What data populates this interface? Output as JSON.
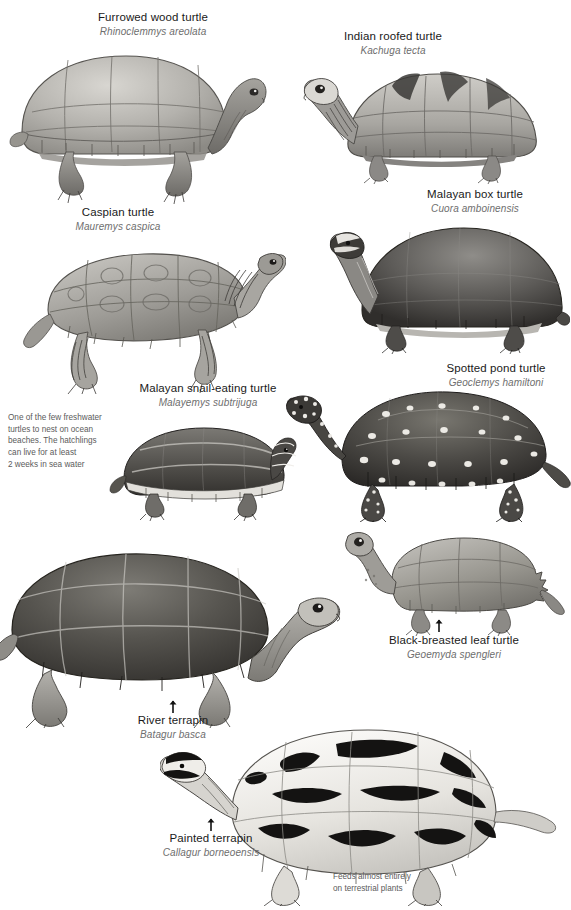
{
  "plate": {
    "title": "Turtles and terrapins illustration plate",
    "background_color": "#ffffff",
    "ink_color": "#1a1a1a",
    "latin_color": "#6e6e6e",
    "note_color": "#5b5b5b"
  },
  "species": [
    {
      "id": "furrowed-wood-turtle",
      "common": "Furrowed wood turtle",
      "latin": "Rhinoclemmys areolata",
      "label_x": 78,
      "label_y": 11,
      "label_align": "center",
      "art_x": 8,
      "art_y": 40,
      "art_w": 260,
      "art_h": 165,
      "pose": "side-right",
      "shell_tone": "#b9b7b2",
      "pattern": "plain-furrowed"
    },
    {
      "id": "indian-roofed-turtle",
      "common": "Indian roofed turtle",
      "latin": "Kachuga tecta",
      "label_x": 318,
      "label_y": 30,
      "label_align": "center",
      "art_x": 300,
      "art_y": 58,
      "art_w": 250,
      "art_h": 120,
      "pose": "side-right",
      "shell_tone": "#b0aeaa",
      "pattern": "keeled-roof"
    },
    {
      "id": "malayan-box-turtle",
      "common": "Malayan box turtle",
      "latin": "Cuora amboinensis",
      "label_x": 400,
      "label_y": 188,
      "label_align": "center",
      "art_x": 320,
      "art_y": 216,
      "art_w": 250,
      "art_h": 135,
      "pose": "side-right",
      "shell_tone": "#6a6864",
      "pattern": "dark-domed"
    },
    {
      "id": "caspian-turtle",
      "common": "Caspian turtle",
      "latin": "Mauremys caspica",
      "label_x": 48,
      "label_y": 206,
      "label_align": "center",
      "art_x": 20,
      "art_y": 228,
      "art_w": 260,
      "art_h": 160,
      "pose": "walking-right",
      "shell_tone": "#a9a7a1",
      "pattern": "ocelli"
    },
    {
      "id": "spotted-pond-turtle",
      "common": "Spotted pond turtle",
      "latin": "Geoclemys hamiltoni",
      "label_x": 450,
      "label_y": 362,
      "label_align": "center",
      "art_x": 288,
      "art_y": 382,
      "art_w": 283,
      "art_h": 140,
      "pose": "walking-right",
      "shell_tone": "#4e4c49",
      "pattern": "white-spots"
    },
    {
      "id": "malayan-snail-eating-turtle",
      "common": "Malayan snail-eating turtle",
      "latin": "Malayemys subtrijuga",
      "label_x": 120,
      "label_y": 382,
      "label_align": "center",
      "art_x": 106,
      "art_y": 414,
      "art_w": 190,
      "art_h": 105,
      "pose": "side-right",
      "shell_tone": "#57554f",
      "pattern": "striped-keel"
    },
    {
      "id": "black-breasted-leaf-turtle",
      "common": "Black-breasted leaf turtle",
      "latin": "Geoemyda spengleri",
      "label_x": 382,
      "label_y": 634,
      "label_align": "center",
      "art_x": 340,
      "art_y": 525,
      "art_w": 225,
      "art_h": 110,
      "pose": "side-right",
      "shell_tone": "#9d9b96",
      "pattern": "serrated-edge"
    },
    {
      "id": "river-terrapin",
      "common": "River terrapin",
      "latin": "Batagur basca",
      "label_x": 112,
      "label_y": 714,
      "label_align": "center",
      "art_x": 0,
      "art_y": 540,
      "art_w": 340,
      "art_h": 185,
      "pose": "side-right",
      "shell_tone": "#56544f",
      "pattern": "large-scutes"
    },
    {
      "id": "painted-terrapin",
      "common": "Painted terrapin",
      "latin": "Callagur borneoensis",
      "label_x": 158,
      "label_y": 832,
      "label_align": "center",
      "art_x": 160,
      "art_y": 718,
      "art_w": 400,
      "art_h": 185,
      "pose": "side-left",
      "shell_tone": "#e8e6e1",
      "pattern": "black-bars"
    }
  ],
  "notes": [
    {
      "id": "note-sea-water",
      "text": "One of the few freshwater\nturtles to nest on ocean\nbeaches. The hatchlings\ncan live for at least\n2 weeks in sea water",
      "x": 8,
      "y": 412,
      "w": 104
    },
    {
      "id": "note-terrestrial-plants",
      "text": "Feeds almost entirely\non terrestrial plants",
      "x": 333,
      "y": 871,
      "w": 130
    }
  ],
  "arrows": [
    {
      "id": "arrow-river-terrapin",
      "x": 168,
      "y": 700,
      "direction": "up"
    },
    {
      "id": "arrow-painted-terrapin",
      "x": 206,
      "y": 818,
      "direction": "up"
    },
    {
      "id": "arrow-black-breasted-leaf-turtle",
      "x": 434,
      "y": 619,
      "direction": "up"
    }
  ]
}
